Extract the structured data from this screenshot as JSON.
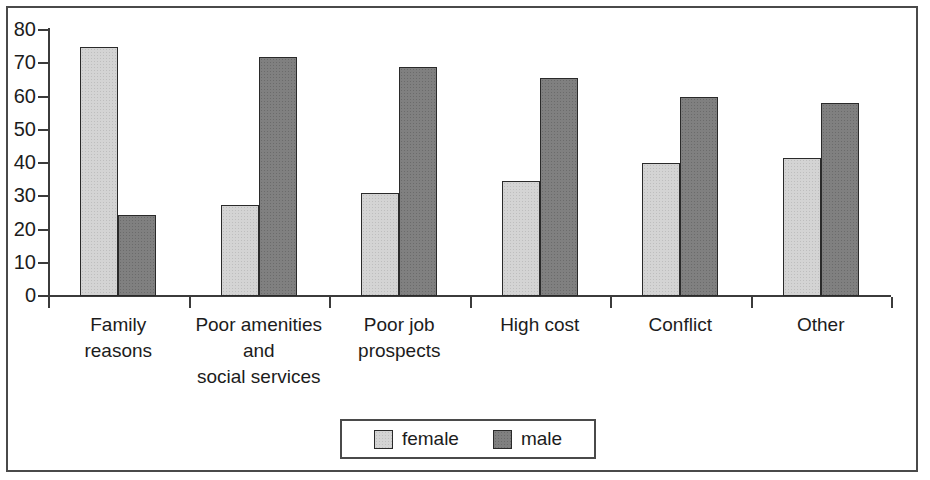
{
  "chart_data": {
    "type": "bar",
    "title": "",
    "subtitle": "",
    "xlabel": "",
    "ylabel": "",
    "ylim": [
      0,
      80
    ],
    "y_ticks": [
      0,
      10,
      20,
      30,
      40,
      50,
      60,
      70,
      80
    ],
    "grid": false,
    "legend_position": "bottom",
    "categories": [
      "Family\nreasons",
      "Poor amenities\nand\nsocial services",
      "Poor job\nprospects",
      "High cost",
      "Conflict",
      "Other"
    ],
    "category_lines": [
      [
        "Family",
        "reasons"
      ],
      [
        "Poor amenities",
        "and",
        "social services"
      ],
      [
        "Poor job",
        "prospects"
      ],
      [
        "High cost"
      ],
      [
        "Conflict"
      ],
      [
        "Other"
      ]
    ],
    "series": [
      {
        "name": "female",
        "color": "#d4d4d4",
        "values": [
          75,
          27.5,
          31,
          34.5,
          40,
          41.5
        ]
      },
      {
        "name": "male",
        "color": "#808080",
        "values": [
          24.5,
          72,
          69,
          65.5,
          60,
          58
        ]
      }
    ]
  },
  "legend": {
    "items": [
      {
        "label": "female",
        "swatch": "female"
      },
      {
        "label": "male",
        "swatch": "male"
      }
    ]
  },
  "axis": {
    "y_tick_labels": [
      "80",
      "70",
      "60",
      "50",
      "40",
      "30",
      "20",
      "10",
      "0"
    ]
  }
}
